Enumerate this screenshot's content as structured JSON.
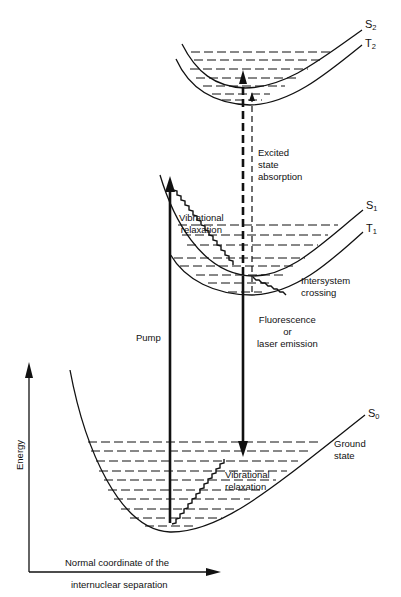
{
  "diagram": {
    "type": "Jablonski / potential energy curve diagram",
    "axes": {
      "y_label": "Energy",
      "x_label_line1": "Normal coordinate of the",
      "x_label_line2": "internuclear separation"
    },
    "states": {
      "s2": {
        "name": "S",
        "sub": "2"
      },
      "t2": {
        "name": "T",
        "sub": "2"
      },
      "s1": {
        "name": "S",
        "sub": "1"
      },
      "t1": {
        "name": "T",
        "sub": "1"
      },
      "s0": {
        "name": "S",
        "sub": "0"
      }
    },
    "labels": {
      "excited_state_absorption": [
        "Excited",
        "state",
        "absorption"
      ],
      "vibrational_relaxation_upper": [
        "Vibrational",
        "relaxation"
      ],
      "intersystem_crossing": [
        "Intersystem",
        "crossing"
      ],
      "fluorescence": [
        "Fluorescence",
        "or",
        "laser emission"
      ],
      "pump": "Pump",
      "ground_state": [
        "Ground",
        "state"
      ],
      "vibrational_relaxation_lower": [
        "Vibrational",
        "relaxation"
      ]
    },
    "colors": {
      "ink": "#111111",
      "background": "#ffffff"
    }
  }
}
